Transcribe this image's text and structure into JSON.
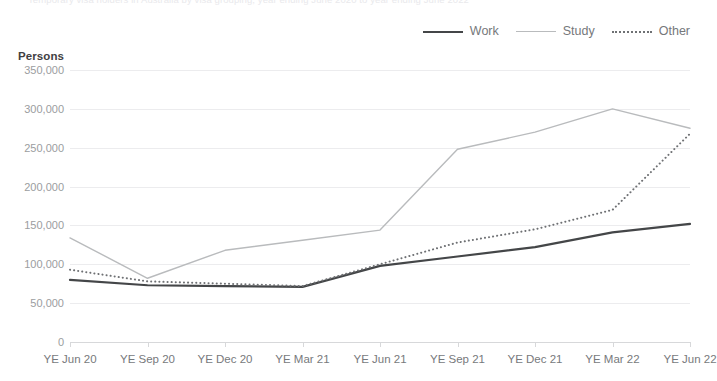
{
  "top_clipped_title": "Temporary visa holders in Australia by visa grouping, year ending June 2020 to year ending June 2022",
  "axis_unit_label": "Persons",
  "legend": {
    "items": [
      {
        "label": "Work",
        "style": "solid-dark",
        "color": "#444648"
      },
      {
        "label": "Study",
        "style": "solid-light",
        "color": "#b9bbbd"
      },
      {
        "label": "Other",
        "style": "dotted",
        "color": "#6f7174"
      }
    ]
  },
  "chart_data": {
    "type": "line",
    "title": "",
    "xlabel": "",
    "ylabel": "Persons",
    "ylim": [
      0,
      350000
    ],
    "ytick_values": [
      0,
      50000,
      100000,
      150000,
      200000,
      250000,
      300000,
      350000
    ],
    "ytick_labels": [
      "0",
      "50,000",
      "100,000",
      "150,000",
      "200,000",
      "250,000",
      "300,000",
      "350,000"
    ],
    "grid": true,
    "legend_position": "top-right",
    "categories": [
      "YE Jun 20",
      "YE Sep 20",
      "YE Dec 20",
      "YE Mar 21",
      "YE Jun 21",
      "YE Sep 21",
      "YE Dec 21",
      "YE Mar 22",
      "YE Jun 22"
    ],
    "series": [
      {
        "name": "Work",
        "color": "#444648",
        "style": "solid",
        "width": 2.2,
        "values": [
          80000,
          73000,
          72000,
          71000,
          98000,
          110000,
          122000,
          141000,
          152000
        ]
      },
      {
        "name": "Study",
        "color": "#b9bbbd",
        "style": "solid",
        "width": 1.4,
        "values": [
          134000,
          82000,
          118000,
          131000,
          144000,
          248000,
          270000,
          300000,
          275000
        ]
      },
      {
        "name": "Other",
        "color": "#6f7174",
        "style": "dotted",
        "width": 2.0,
        "values": [
          93000,
          78000,
          75000,
          72000,
          100000,
          128000,
          145000,
          170000,
          268000
        ]
      }
    ]
  }
}
